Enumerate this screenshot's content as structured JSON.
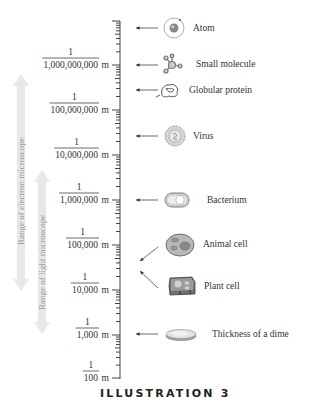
{
  "title": "ILLUSTRATION 3",
  "scale": {
    "unit": "m",
    "labels": [
      {
        "numerator": "1",
        "denominator": "1,000,000,000",
        "unit": "m"
      },
      {
        "numerator": "1",
        "denominator": "100,000,000",
        "unit": "m"
      },
      {
        "numerator": "1",
        "denominator": "10,000,000",
        "unit": "m"
      },
      {
        "numerator": "1",
        "denominator": "1,000,000",
        "unit": "m"
      },
      {
        "numerator": "1",
        "denominator": "100,000",
        "unit": "m"
      },
      {
        "numerator": "1",
        "denominator": "10,000",
        "unit": "m"
      },
      {
        "numerator": "1",
        "denominator": "1,000",
        "unit": "m"
      },
      {
        "numerator": "1",
        "denominator": "100",
        "unit": "m"
      }
    ]
  },
  "objects": [
    {
      "label": "Atom",
      "icon": "atom-icon"
    },
    {
      "label": "Small molecule",
      "icon": "molecule-icon"
    },
    {
      "label": "Globular protein",
      "icon": "protein-icon"
    },
    {
      "label": "Virus",
      "icon": "virus-icon"
    },
    {
      "label": "Bacterium",
      "icon": "bacterium-icon"
    },
    {
      "label": "Animal cell",
      "icon": "animal-cell-icon"
    },
    {
      "label": "Plant cell",
      "icon": "plant-cell-icon"
    },
    {
      "label": "Thickness of a dime",
      "icon": "dime-icon"
    }
  ],
  "ranges": [
    {
      "label": "Range of electron microscope"
    },
    {
      "label": "Range of light microscope"
    }
  ],
  "colors": {
    "range_arrow": "#e6e6e6",
    "range_text": "#9a9a9a",
    "ink": "#333333",
    "icon_fill": "#cfcfcf",
    "icon_dark": "#8a8a8a"
  }
}
